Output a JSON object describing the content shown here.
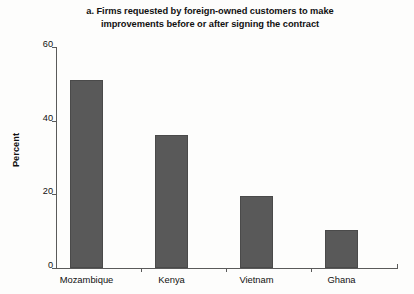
{
  "chart_data": {
    "type": "bar",
    "title": "a. Firms requested by foreign-owned customers to make improvements before or after signing the contract",
    "title_lines": [
      "a. Firms requested by foreign-owned customers to make",
      "improvements before or after signing the contract"
    ],
    "xlabel": "",
    "ylabel": "Percent",
    "categories": [
      "Mozambique",
      "Kenya",
      "Vietnam",
      "Ghana"
    ],
    "values": [
      51,
      36,
      19.5,
      10.3
    ],
    "ylim": [
      0,
      60
    ],
    "yticks": [
      0,
      20,
      40,
      60
    ],
    "ytick_labels": [
      "0",
      "20",
      "40",
      "60"
    ],
    "grid": false,
    "legend": null,
    "bar_color": "#595959",
    "axis_color": "#5a5a5a",
    "background_color": "#fdfdfc"
  },
  "figure": {
    "panel_letter": "a.",
    "title_line_1": "a. Firms requested by foreign-owned customers to make",
    "title_line_2": "improvements before or after signing the contract",
    "y_axis_title": "Percent",
    "ytick_0": "0",
    "ytick_1": "20",
    "ytick_2": "40",
    "ytick_3": "60",
    "cat_0": "Mozambique",
    "cat_1": "Kenya",
    "cat_2": "Vietnam",
    "cat_3": "Ghana"
  }
}
